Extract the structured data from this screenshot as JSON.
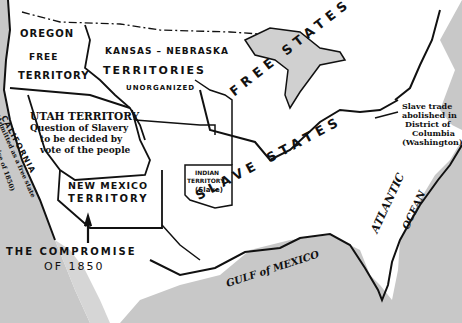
{
  "map": {
    "title": "THE COMPROMISE OF 1850",
    "title_line1": "THE COMPROMISE",
    "title_line2": "OF 1850",
    "colors": {
      "water": "#c8c8c8",
      "land": "#ffffff",
      "border": "#111111"
    },
    "regions": {
      "oregon": {
        "line1": "OREGON",
        "line2": "FREE",
        "line3": "TERRITORY"
      },
      "kansas_nebraska": {
        "line1": "KANSAS – NEBRASKA",
        "line2": "TERRITORIES",
        "line3": "UNORGANIZED"
      },
      "utah": {
        "line1": "UTAH TERRITORY",
        "line2": "Question of Slavery",
        "line3": "to be decided by",
        "line4": "vote of the people"
      },
      "california": {
        "line1": "CALIFORNIA",
        "line2": "(Admitted as a free state",
        "line3": "Compromise of 1850)"
      },
      "new_mexico": {
        "line1": "NEW MEXICO",
        "line2": "TERRITORY"
      },
      "indian": {
        "line1": "INDIAN",
        "line2": "TERRITORY",
        "line3": "(Slave)"
      },
      "free_states": {
        "label": "FREE STATES"
      },
      "slave_states": {
        "label": "SLAVE STATES"
      },
      "dc_note": {
        "line1": "Slave trade",
        "line2": "abolished in",
        "line3": "District of",
        "line4": "Columbia",
        "line5": "(Washington)"
      }
    },
    "water_labels": {
      "gulf": "GULF of MEXICO",
      "atlantic_1": "ATLANTIC",
      "atlantic_2": "OCEAN"
    }
  }
}
